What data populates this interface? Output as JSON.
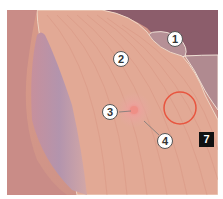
{
  "figure": {
    "labels": [
      {
        "id": "1",
        "text": "1"
      },
      {
        "id": "2",
        "text": "2"
      },
      {
        "id": "3",
        "text": "3"
      },
      {
        "id": "4",
        "text": "4"
      }
    ],
    "badge": "7",
    "colors": {
      "skin": "#e2a995",
      "muscle_lines": "#d8907c",
      "shadow": "#b08aa0",
      "dark_bg": "#8c5d6b",
      "circle_marker": "#e8553f",
      "areola": "#e79a93"
    }
  }
}
